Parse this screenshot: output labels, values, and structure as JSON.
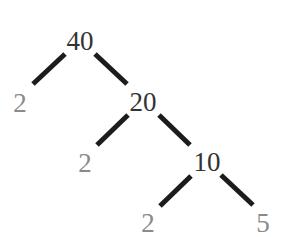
{
  "diagram": {
    "type": "factor-tree",
    "colors": {
      "edge": "#1c1c1c",
      "composite_text": "#333333",
      "prime_text": "#8a8a8a",
      "background": "#ffffff"
    },
    "nodes": [
      {
        "id": "n40",
        "label": "40",
        "kind": "composite",
        "x": 80,
        "y": 50
      },
      {
        "id": "n2a",
        "label": "2",
        "kind": "prime",
        "x": 20,
        "y": 112
      },
      {
        "id": "n20",
        "label": "20",
        "kind": "composite",
        "x": 143,
        "y": 111
      },
      {
        "id": "n2b",
        "label": "2",
        "kind": "prime",
        "x": 85,
        "y": 172
      },
      {
        "id": "n10",
        "label": "10",
        "kind": "composite",
        "x": 207,
        "y": 171
      },
      {
        "id": "n2c",
        "label": "2",
        "kind": "prime",
        "x": 148,
        "y": 232
      },
      {
        "id": "n5",
        "label": "5",
        "kind": "prime",
        "x": 263,
        "y": 232
      }
    ],
    "edges": [
      {
        "from": "n40",
        "to": "n2a",
        "x1": 65,
        "y1": 54,
        "x2": 33,
        "y2": 84
      },
      {
        "from": "n40",
        "to": "n20",
        "x1": 95,
        "y1": 54,
        "x2": 127,
        "y2": 84
      },
      {
        "from": "n20",
        "to": "n2b",
        "x1": 128,
        "y1": 115,
        "x2": 97,
        "y2": 145
      },
      {
        "from": "n20",
        "to": "n10",
        "x1": 159,
        "y1": 115,
        "x2": 190,
        "y2": 145
      },
      {
        "from": "n10",
        "to": "n2c",
        "x1": 191,
        "y1": 176,
        "x2": 160,
        "y2": 206
      },
      {
        "from": "n10",
        "to": "n5",
        "x1": 221,
        "y1": 175,
        "x2": 253,
        "y2": 205
      }
    ]
  }
}
